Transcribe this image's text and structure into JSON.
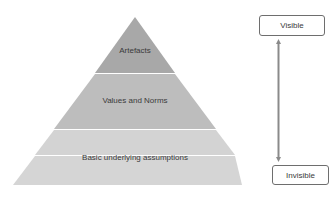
{
  "diagram": {
    "layers": [
      {
        "label": "Artefacts",
        "color": "#a8a8a8"
      },
      {
        "label": "Values and Norms",
        "color": "#bdbdbd"
      },
      {
        "label": "Basic underlying assumptions",
        "color": "#d3d3d3"
      }
    ],
    "scale": {
      "top_label": "Visible",
      "bottom_label": "Invisible",
      "arrow": "double-headed vertical arrow"
    }
  }
}
